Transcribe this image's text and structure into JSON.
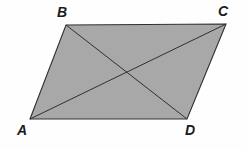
{
  "figure": {
    "kind": "parallelogram-with-diagonals",
    "background_color": "#fefefe",
    "fill_color": "#a8a8a8",
    "stroke_color": "#303030",
    "label_color": "#1a1a1a",
    "stroke_width": 1.1,
    "diagonal_stroke_width": 1.0,
    "vertices": [
      {
        "id": "A",
        "label": "A",
        "x": 30,
        "y": 119,
        "label_x": 17,
        "label_y": 123
      },
      {
        "id": "B",
        "label": "B",
        "x": 66,
        "y": 25,
        "label_x": 57,
        "label_y": 5
      },
      {
        "id": "C",
        "label": "C",
        "x": 226,
        "y": 24,
        "label_x": 218,
        "label_y": 4
      },
      {
        "id": "D",
        "label": "D",
        "x": 187,
        "y": 119,
        "label_x": 185,
        "label_y": 123
      }
    ],
    "outline_path": "M 30 119 L 66 25 L 226 24 L 187 119 Z",
    "diagonals": [
      {
        "id": "AC",
        "from": "A",
        "to": "C",
        "x1": 30,
        "y1": 119,
        "x2": 226,
        "y2": 24
      },
      {
        "id": "BD",
        "from": "B",
        "to": "D",
        "x1": 66,
        "y1": 25,
        "x2": 187,
        "y2": 119
      }
    ],
    "intersection": {
      "id": "diagonal-intersection",
      "x": 128,
      "y": 72
    }
  }
}
